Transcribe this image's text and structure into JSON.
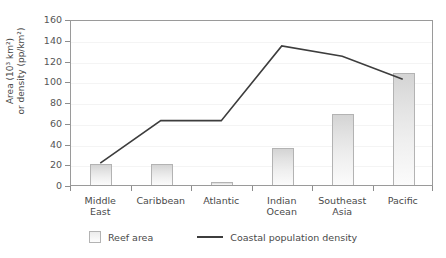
{
  "chart_data": {
    "type": "bar",
    "title": "",
    "subtitle": "",
    "xlabel": "",
    "ylabel": "Area (10³ km²)\nor density (pp/km²)",
    "ylim": [
      0,
      160
    ],
    "yticks": [
      0,
      20,
      40,
      60,
      80,
      100,
      120,
      140,
      160
    ],
    "grid": true,
    "grid_axis": "y",
    "legend_position": "bottom-center",
    "categories": [
      "Middle\nEast",
      "Caribbean",
      "Atlantic",
      "Indian\nOcean",
      "Southeast\nAsia",
      "Pacific"
    ],
    "categories_plain": [
      "Middle East",
      "Caribbean",
      "Atlantic",
      "Indian Ocean",
      "Southeast Asia",
      "Pacific"
    ],
    "series": [
      {
        "name": "Reef area",
        "type": "bar",
        "color": "#e4e4e4",
        "edge_color": "#b3b3b3",
        "values": [
          20,
          20,
          3,
          36,
          68,
          108
        ]
      },
      {
        "name": "Coastal population density",
        "type": "line",
        "color": "#3d3d3d",
        "values": [
          22,
          63,
          63,
          135,
          125,
          103
        ]
      }
    ]
  },
  "axis": {
    "y_title_line1": "Area (10³ km²)",
    "y_title_line2": "or density (pp/km²)",
    "y_tick_labels": [
      "160",
      "140",
      "120",
      "100",
      "80",
      "60",
      "40",
      "20",
      "0"
    ]
  },
  "legend": {
    "entries": [
      {
        "label": "Reef area",
        "marker": "bar-swatch"
      },
      {
        "label": "Coastal population density",
        "marker": "line-swatch"
      }
    ]
  },
  "colors": {
    "line": "#3d3d3d",
    "bar_edge": "#b3b3b3",
    "bar_fill_top": "#d4d4d4",
    "bar_fill_bottom": "#fbfbfb",
    "frame": "#9a9a9a",
    "gridline": "#f4f4f4",
    "text": "#4a4a4a",
    "background": "#ffffff"
  }
}
